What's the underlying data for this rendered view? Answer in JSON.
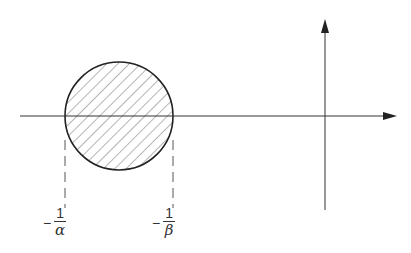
{
  "diagram": {
    "stroke_color": "#222222",
    "labels": {
      "left": {
        "sign": "−",
        "numerator": "1",
        "denominator": "α"
      },
      "right": {
        "sign": "−",
        "numerator": "1",
        "denominator": "β"
      }
    }
  }
}
